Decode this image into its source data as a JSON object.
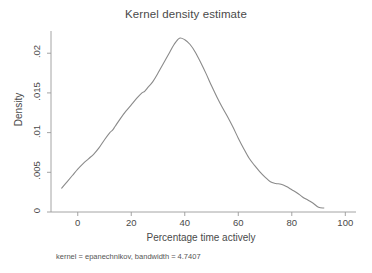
{
  "chart_data": {
    "type": "line",
    "title": "Kernel density estimate",
    "xlabel": "Percentage time actively",
    "ylabel": "Density",
    "note": "kernel = epanechnikov, bandwidth = 4.7407",
    "xlim": [
      -10,
      104
    ],
    "ylim": [
      0,
      0.0228
    ],
    "grid": false,
    "legend": null,
    "xticks": [
      0,
      20,
      40,
      60,
      80,
      100
    ],
    "xtick_labels": [
      "0",
      "20",
      "40",
      "60",
      "80",
      "100"
    ],
    "yticks": [
      0,
      0.005,
      0.01,
      0.015,
      0.02
    ],
    "ytick_labels": [
      "0",
      ".005",
      ".01",
      ".015",
      ".02"
    ],
    "series": [
      {
        "name": "Density",
        "x": [
          -6.0,
          -4.0,
          -2.0,
          0.0,
          2.0,
          4.0,
          6.0,
          8.0,
          10.0,
          12.0,
          13.0,
          14.0,
          16.0,
          18.0,
          20.0,
          22.0,
          24.0,
          25.0,
          26.0,
          28.0,
          30.0,
          32.0,
          34.0,
          36.0,
          38.0,
          40.0,
          42.0,
          44.0,
          46.0,
          48.0,
          50.0,
          52.0,
          54.0,
          56.0,
          58.0,
          60.0,
          62.0,
          64.0,
          66.0,
          68.0,
          70.0,
          72.0,
          74.0,
          76.0,
          78.0,
          80.0,
          82.0,
          84.0,
          86.0,
          88.0,
          90.0,
          92.0
        ],
        "y": [
          0.003,
          0.0038,
          0.0046,
          0.0054,
          0.0061,
          0.0067,
          0.0073,
          0.0081,
          0.0091,
          0.01,
          0.0103,
          0.0108,
          0.0118,
          0.0127,
          0.0135,
          0.0143,
          0.015,
          0.0152,
          0.0156,
          0.0164,
          0.0175,
          0.0187,
          0.0199,
          0.0211,
          0.0219,
          0.0217,
          0.0211,
          0.0201,
          0.0188,
          0.0174,
          0.0159,
          0.0145,
          0.0132,
          0.012,
          0.0107,
          0.0093,
          0.008,
          0.0068,
          0.0059,
          0.0051,
          0.0044,
          0.0038,
          0.0036,
          0.0035,
          0.0032,
          0.0028,
          0.0024,
          0.0019,
          0.0015,
          0.0011,
          0.0006,
          0.0005
        ]
      }
    ],
    "colors": {
      "line": "#8a8a8a",
      "axis": "#9a9a9a",
      "text": "#4a4a4a",
      "background": "#ffffff"
    }
  }
}
